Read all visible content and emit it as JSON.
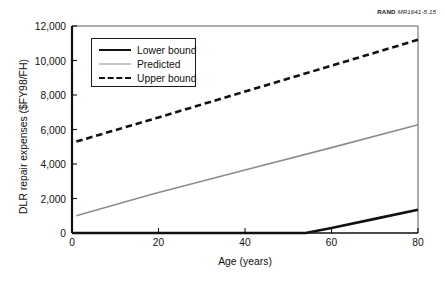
{
  "credit": {
    "brand": "RAND",
    "code": "MR1641-5.15"
  },
  "chart_data": {
    "type": "line",
    "title": "",
    "xlabel": "Age (years)",
    "ylabel": "DLR repair expenses ($FY98/FH)",
    "xlim": [
      0,
      80
    ],
    "ylim": [
      0,
      12000
    ],
    "xticks": [
      0,
      20,
      40,
      60,
      80
    ],
    "xtick_labels": [
      "0",
      "20",
      "40",
      "60",
      "80"
    ],
    "yticks": [
      0,
      2000,
      4000,
      6000,
      8000,
      10000,
      12000
    ],
    "ytick_labels": [
      "0",
      "2,000",
      "4,000",
      "6,000",
      "8,000",
      "10,000",
      "12,000"
    ],
    "grid": false,
    "legend_position": "upper left",
    "series": [
      {
        "name": "Lower bound",
        "style": "solid",
        "color": "#111111",
        "width": 2.6,
        "x": [
          0,
          54,
          60,
          70,
          80
        ],
        "values": [
          0,
          0,
          290,
          820,
          1350
        ]
      },
      {
        "name": "Predicted",
        "style": "solid",
        "color": "#8d8d8d",
        "width": 1.6,
        "x": [
          1,
          15,
          20,
          40,
          60,
          80
        ],
        "values": [
          1000,
          2000,
          2350,
          3650,
          4950,
          6280
        ]
      },
      {
        "name": "Upper bound",
        "style": "dashed",
        "color": "#111111",
        "width": 2.6,
        "x": [
          1,
          20,
          40,
          60,
          80
        ],
        "values": [
          5300,
          6700,
          8200,
          9700,
          11200
        ]
      }
    ]
  },
  "legend": {
    "items": [
      {
        "label": "Lower bound"
      },
      {
        "label": "Predicted"
      },
      {
        "label": "Upper bound"
      }
    ]
  }
}
